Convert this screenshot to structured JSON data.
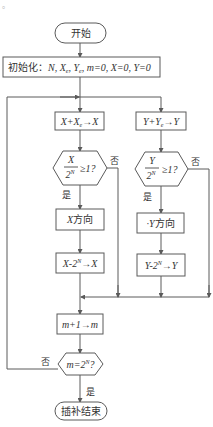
{
  "corner_mark": "。",
  "nodes": {
    "start": {
      "label": "开始"
    },
    "init": {
      "prefix": "初始化：",
      "vars": "N, X",
      "xe_sub": "e",
      "sep1": ", Y",
      "ye_sub": "e",
      "rest": ", m=0, X=0, Y=0"
    },
    "x_add": {
      "lhs": "X+X",
      "sub": "e",
      "rhs": "→X"
    },
    "y_add": {
      "lhs": "Y+Y",
      "sub": "e",
      "rhs": "→Y"
    },
    "x_cond": {
      "num": "X",
      "den": "2",
      "den_sup": "N",
      "rel": "≥1?"
    },
    "y_cond": {
      "num": "Y",
      "den": "2",
      "den_sup": "N",
      "rel": "≥1?"
    },
    "x_dir": {
      "var": "X",
      "text": "方向"
    },
    "y_dir": {
      "var": "·Y",
      "text": "方向"
    },
    "x_sub": {
      "lhs": "X-2",
      "sup": "N",
      "rhs": "→X"
    },
    "y_sub": {
      "lhs": "Y-2",
      "sup": "N",
      "rhs": "→Y"
    },
    "m_inc": {
      "text": "m+1→m"
    },
    "m_cond": {
      "lhs": "m=2",
      "sup": "N",
      "q": "?"
    },
    "end": {
      "label": "插补结束"
    }
  },
  "edge_labels": {
    "x_yes": "是",
    "x_no": "否",
    "y_yes": "是",
    "y_no": "否",
    "m_yes": "是",
    "m_no": "否"
  },
  "colors": {
    "stroke": "#5a5a5a",
    "text": "#333333",
    "background": "#ffffff"
  }
}
